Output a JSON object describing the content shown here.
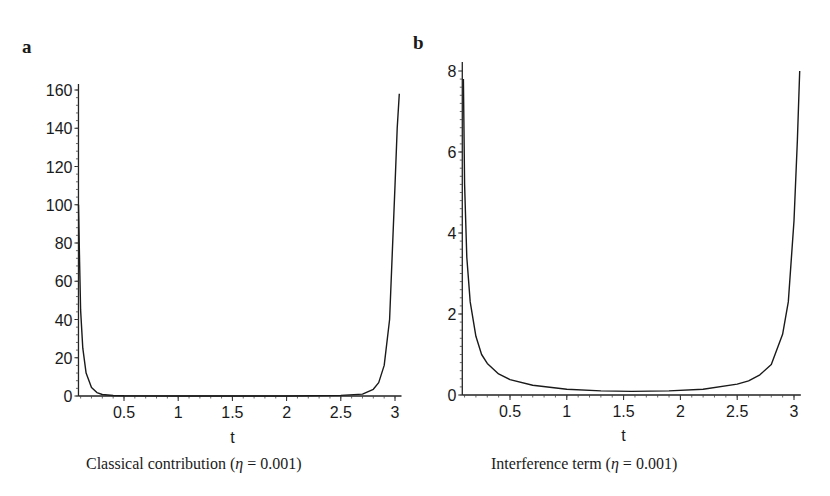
{
  "chart_data": [
    {
      "panel": "a",
      "type": "line",
      "title": "Classical contribution (η = 0.001)",
      "caption_prefix": "Classical contribution (",
      "caption_symbol": "η",
      "caption_suffix": " = 0.001)",
      "xlabel": "t",
      "ylabel": "",
      "xlim": [
        0.08,
        3.06
      ],
      "ylim": [
        0,
        160
      ],
      "xticks": [
        0.5,
        1,
        1.5,
        2,
        2.5,
        3
      ],
      "xtick_labels": [
        "0.5",
        "1",
        "1.5",
        "2",
        "2.5",
        "3"
      ],
      "yticks": [
        0,
        20,
        40,
        60,
        80,
        100,
        120,
        140,
        160
      ],
      "ytick_labels": [
        "0",
        "20",
        "40",
        "60",
        "80",
        "100",
        "120",
        "140",
        "160"
      ],
      "grid": false,
      "series": [
        {
          "name": "classical",
          "x": [
            0.08,
            0.09,
            0.1,
            0.12,
            0.15,
            0.2,
            0.25,
            0.3,
            0.4,
            0.5,
            1.0,
            1.5,
            2.0,
            2.5,
            2.7,
            2.8,
            2.85,
            2.9,
            2.95,
            3.0,
            3.02,
            3.04
          ],
          "y": [
            100,
            70,
            45,
            25,
            12,
            4.5,
            1.8,
            0.8,
            0.25,
            0.1,
            0.02,
            0.01,
            0.02,
            0.3,
            1.0,
            3.5,
            7,
            16,
            40,
            110,
            140,
            158
          ]
        }
      ]
    },
    {
      "panel": "b",
      "type": "line",
      "title": "Interference term (η = 0.001)",
      "caption_prefix": "Interference term (",
      "caption_symbol": "η",
      "caption_suffix": " = 0.001)",
      "xlabel": "t",
      "ylabel": "",
      "xlim": [
        0.08,
        3.06
      ],
      "ylim": [
        0,
        8
      ],
      "xticks": [
        0.5,
        1,
        1.5,
        2,
        2.5,
        3
      ],
      "xtick_labels": [
        "0.5",
        "1",
        "1.5",
        "2",
        "2.5",
        "3"
      ],
      "yticks": [
        0,
        2,
        4,
        6,
        8
      ],
      "ytick_labels": [
        "0",
        "2",
        "4",
        "6",
        "8"
      ],
      "grid": false,
      "series": [
        {
          "name": "interference",
          "x": [
            0.09,
            0.1,
            0.12,
            0.15,
            0.2,
            0.25,
            0.3,
            0.4,
            0.5,
            0.7,
            1.0,
            1.3,
            1.57,
            1.9,
            2.2,
            2.5,
            2.6,
            2.7,
            2.8,
            2.9,
            2.95,
            3.0,
            3.03,
            3.05
          ],
          "y": [
            7.8,
            5.2,
            3.4,
            2.3,
            1.45,
            1.0,
            0.78,
            0.52,
            0.38,
            0.24,
            0.14,
            0.1,
            0.09,
            0.1,
            0.14,
            0.27,
            0.35,
            0.5,
            0.75,
            1.5,
            2.3,
            4.3,
            6.3,
            8.0
          ]
        }
      ]
    }
  ],
  "panels": {
    "a": {
      "label": "a"
    },
    "b": {
      "label": "b"
    }
  }
}
